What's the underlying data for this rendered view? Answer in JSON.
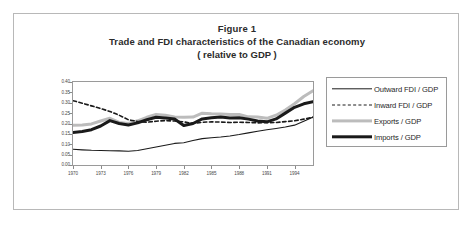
{
  "figure": {
    "title_line_1": "Figure 1",
    "title_line_2": "Trade and FDI characteristics of the Canadian economy",
    "title_line_3": "( relative to GDP )"
  },
  "chart_data": {
    "type": "line",
    "title": "Trade and FDI characteristics of the Canadian economy ( relative to GDP )",
    "xlabel": "",
    "ylabel": "",
    "xlim": [
      1970,
      1996
    ],
    "ylim": [
      0.0,
      0.4
    ],
    "grid": false,
    "legend_position": "right",
    "x": [
      1970,
      1971,
      1972,
      1973,
      1974,
      1975,
      1976,
      1977,
      1978,
      1979,
      1980,
      1981,
      1982,
      1983,
      1984,
      1985,
      1986,
      1987,
      1988,
      1989,
      1990,
      1991,
      1992,
      1993,
      1994,
      1995,
      1996
    ],
    "xticks": [
      1970,
      1973,
      1976,
      1979,
      1982,
      1985,
      1988,
      1991,
      1994
    ],
    "yticks": [
      0.0,
      0.05,
      0.1,
      0.15,
      0.2,
      0.25,
      0.3,
      0.35,
      0.4
    ],
    "ytick_labels": [
      "0.00",
      "0.05",
      "0.10",
      "0.15",
      "0.20",
      "0.25",
      "0.30",
      "0.35",
      "0.40"
    ],
    "xtick_labels": [
      "1970",
      "1973",
      "1976",
      "1979",
      "1982",
      "1985",
      "1988",
      "1991",
      "1994"
    ],
    "series": [
      {
        "name": "Outward FDI / GDP",
        "color": "#1a1a1a",
        "style": "solid",
        "width": 1.1,
        "values": [
          0.076,
          0.073,
          0.071,
          0.07,
          0.069,
          0.068,
          0.066,
          0.07,
          0.078,
          0.087,
          0.095,
          0.104,
          0.107,
          0.118,
          0.127,
          0.131,
          0.135,
          0.14,
          0.147,
          0.155,
          0.163,
          0.17,
          0.176,
          0.183,
          0.192,
          0.211,
          0.231
        ]
      },
      {
        "name": "Inward FDI / GDP",
        "color": "#1a1a1a",
        "style": "dashed",
        "width": 1.6,
        "values": [
          0.31,
          0.298,
          0.285,
          0.272,
          0.258,
          0.24,
          0.218,
          0.21,
          0.206,
          0.211,
          0.214,
          0.212,
          0.208,
          0.2,
          0.206,
          0.208,
          0.207,
          0.205,
          0.206,
          0.205,
          0.203,
          0.204,
          0.205,
          0.209,
          0.213,
          0.221,
          0.23
        ]
      },
      {
        "name": "Exports / GDP",
        "color": "#bcbcbc",
        "style": "solid",
        "width": 3.0,
        "values": [
          0.192,
          0.193,
          0.198,
          0.212,
          0.225,
          0.205,
          0.2,
          0.213,
          0.23,
          0.244,
          0.24,
          0.231,
          0.23,
          0.231,
          0.25,
          0.247,
          0.246,
          0.243,
          0.243,
          0.232,
          0.231,
          0.225,
          0.24,
          0.265,
          0.295,
          0.33,
          0.358
        ]
      },
      {
        "name": "Imports / GDP",
        "color": "#1a1a1a",
        "style": "solid",
        "width": 3.0,
        "values": [
          0.157,
          0.161,
          0.17,
          0.188,
          0.214,
          0.2,
          0.193,
          0.203,
          0.218,
          0.23,
          0.227,
          0.222,
          0.19,
          0.2,
          0.222,
          0.228,
          0.231,
          0.226,
          0.228,
          0.221,
          0.212,
          0.208,
          0.222,
          0.25,
          0.278,
          0.295,
          0.305
        ]
      }
    ]
  },
  "legend": {
    "items": [
      {
        "label": "Outward FDI / GDP",
        "swatch": "solid-thin"
      },
      {
        "label": "Inward FDI / GDP",
        "swatch": "dashed"
      },
      {
        "label": "Exports / GDP",
        "swatch": "solid-gray"
      },
      {
        "label": "Imports / GDP",
        "swatch": "solid-thick"
      }
    ]
  }
}
